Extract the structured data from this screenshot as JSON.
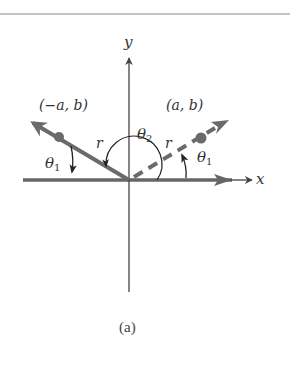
{
  "diagram": {
    "axes": {
      "x_label": "x",
      "y_label": "y",
      "origin_px": [
        129,
        180
      ]
    },
    "points": [
      {
        "label": "(−a, b)",
        "description": "point in second quadrant on solid ray"
      },
      {
        "label": "(a, b)",
        "description": "point in first quadrant on dashed ray"
      }
    ],
    "radius_labels": [
      "r",
      "r"
    ],
    "angles": [
      {
        "label": "θ",
        "subscript": "1",
        "position": "left, between solid ray and negative x-axis"
      },
      {
        "label": "θ",
        "subscript": "2",
        "position": "arc from positive x-axis to solid ray"
      },
      {
        "label": "θ",
        "subscript": "1",
        "position": "right, between positive x-axis and dashed ray"
      }
    ],
    "caption": "(a)",
    "colors": {
      "ray": "#6a6a6a",
      "axis": "#555555",
      "text": "#333333",
      "rule": "#888888"
    }
  }
}
